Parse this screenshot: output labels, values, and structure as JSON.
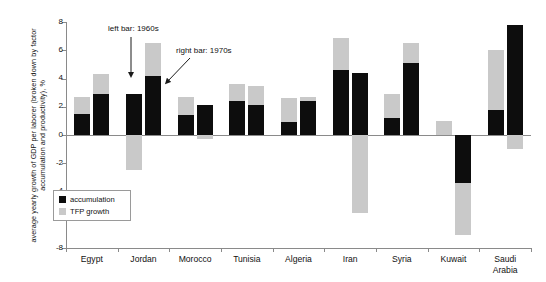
{
  "chart_data": {
    "type": "bar",
    "title": "",
    "xlabel": "",
    "ylabel": "average yearly growth of GDP per laborer (broken down by factor accumulation and productivity), %",
    "ylim": [
      -8,
      8
    ],
    "yticks": [
      8,
      6,
      4,
      2,
      0,
      -2,
      -4,
      -6,
      -8
    ],
    "ytick_labels": [
      "8",
      "6",
      "4",
      "2",
      "0",
      "-2",
      "-4",
      "-6",
      "-8"
    ],
    "grid": false,
    "legend_position": "inside-left-lower",
    "stacked": true,
    "categories": [
      "Egypt",
      "Jordan",
      "Morocco",
      "Tunisia",
      "Algeria",
      "Iran",
      "Syria",
      "Kuwait",
      "Saudi Arabia"
    ],
    "bar_groups": [
      "1960s",
      "1970s"
    ],
    "series": [
      {
        "name": "accumulation",
        "color": "#0d0d0d",
        "values_1960s": [
          1.5,
          2.9,
          1.4,
          2.4,
          0.9,
          4.6,
          1.2,
          0.0,
          1.8
        ],
        "values_1970s": [
          2.9,
          4.2,
          2.1,
          2.1,
          2.4,
          4.4,
          5.1,
          -3.4,
          7.8
        ]
      },
      {
        "name": "TFP growth",
        "color": "#c9c9c9",
        "values_1960s": [
          1.2,
          -2.5,
          1.3,
          1.2,
          1.7,
          2.3,
          1.7,
          1.0,
          4.2
        ],
        "values_1970s": [
          1.4,
          2.3,
          -0.3,
          1.4,
          0.3,
          -5.5,
          1.4,
          -3.7,
          -1.0
        ]
      }
    ],
    "annotations": [
      {
        "name": "left-bar-note",
        "text": "left bar: 1960s"
      },
      {
        "name": "right-bar-note",
        "text": "right bar: 1970s"
      }
    ]
  },
  "legend": {
    "items": [
      {
        "label": "accumulation",
        "color": "#0d0d0d"
      },
      {
        "label": "TFP growth",
        "color": "#c9c9c9"
      }
    ]
  },
  "axis": {
    "y_label_text": "average yearly growth of GDP per laborer (broken down by factor accumulation and productivity), %",
    "y_ticks": [
      "8",
      "6",
      "4",
      "2",
      "0",
      "-2",
      "-4",
      "-6",
      "-8"
    ]
  },
  "categories": [
    {
      "label": "Egypt"
    },
    {
      "label": "Jordan"
    },
    {
      "label": "Morocco"
    },
    {
      "label": "Tunisia"
    },
    {
      "label": "Algeria"
    },
    {
      "label": "Iran"
    },
    {
      "label": "Syria"
    },
    {
      "label": "Kuwait"
    },
    {
      "label": "Saudi\nArabia"
    }
  ],
  "annotations": {
    "left_bar": "left bar: 1960s",
    "right_bar": "right bar: 1970s"
  }
}
